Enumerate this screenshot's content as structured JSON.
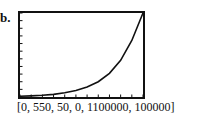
{
  "problem_label": "b.",
  "window_caption": "[0, 550, 50, 0, 1100000, 100000]",
  "chart_data": {
    "type": "line",
    "title": "",
    "xlabel": "",
    "ylabel": "",
    "window": {
      "xmin": 0,
      "xmax": 550,
      "xscl": 50,
      "ymin": 0,
      "ymax": 1100000,
      "yscl": 100000
    },
    "xlim": [
      0,
      550
    ],
    "ylim": [
      0,
      1100000
    ],
    "grid": false,
    "series": [
      {
        "name": "exponential curve",
        "x": [
          0,
          50,
          100,
          150,
          200,
          250,
          300,
          350,
          400,
          450,
          500,
          550
        ],
        "y": [
          10000,
          15000,
          23000,
          35000,
          55000,
          85000,
          130000,
          200000,
          310000,
          480000,
          740000,
          1100000
        ]
      }
    ]
  }
}
